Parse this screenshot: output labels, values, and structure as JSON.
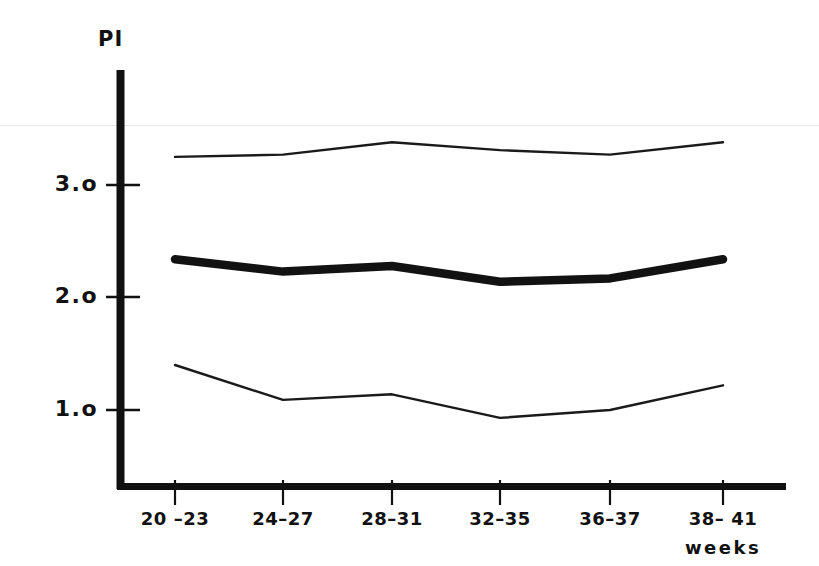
{
  "chart_data": {
    "type": "line",
    "title": "",
    "ylabel": "PI",
    "xlabel": "weeks",
    "categories": [
      "20 –23",
      "24–27",
      "28–31",
      "32–35",
      "36–37",
      "38– 41"
    ],
    "x_pixels": [
      175,
      283,
      392,
      500,
      610,
      723
    ],
    "ylim": [
      0.0,
      3.8
    ],
    "yticks": [
      1.0,
      2.0,
      3.0
    ],
    "ytick_labels": [
      "1.o",
      "2.o",
      "3.o"
    ],
    "grid": false,
    "legend": "none",
    "series": [
      {
        "name": "upper reference limit",
        "style": "thin",
        "values": [
          3.25,
          3.27,
          3.38,
          3.31,
          3.27,
          3.38
        ]
      },
      {
        "name": "mean",
        "style": "thick",
        "values": [
          2.34,
          2.23,
          2.28,
          2.14,
          2.17,
          2.34
        ]
      },
      {
        "name": "lower reference limit",
        "style": "thin",
        "values": [
          1.4,
          1.09,
          1.14,
          0.93,
          1.0,
          1.22
        ]
      }
    ],
    "colors": {
      "ink": "#111111",
      "axis": "#111111",
      "background": "#ffffff",
      "scan_artifact": "#e8e8e8"
    }
  },
  "axes": {
    "y_title": "PI",
    "y_tick_labels": [
      "3.o",
      "2.o",
      "1.o"
    ],
    "x_tick_labels": [
      "20 –23",
      "24–27",
      "28–31",
      "32–35",
      "36–37",
      "38– 41"
    ],
    "x_unit_label": "weeks"
  }
}
